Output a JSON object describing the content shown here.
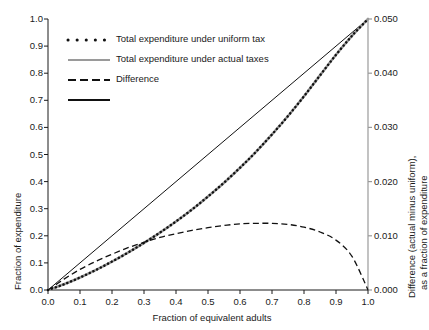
{
  "chart_data": {
    "type": "line",
    "title": "",
    "xlabel": "Fraction of equivalent adults",
    "ylabel": "Fraction of expenditure",
    "ylabel_right_line1": "Difference (actual minus uniform),",
    "ylabel_right_line2": "as a fraction of expenditure",
    "xlim": [
      0.0,
      1.0
    ],
    "ylim": [
      0.0,
      1.0
    ],
    "ylim_right": [
      0.0,
      0.05
    ],
    "grid": false,
    "legend_position": "upper left",
    "xticks": [
      "0.0",
      "0.1",
      "0.2",
      "0.3",
      "0.4",
      "0.5",
      "0.6",
      "0.7",
      "0.8",
      "0.9",
      "1.0"
    ],
    "xtick_values": [
      0.0,
      0.1,
      0.2,
      0.3,
      0.4,
      0.5,
      0.6,
      0.7,
      0.8,
      0.9,
      1.0
    ],
    "yticks": [
      "0.0",
      "0.1",
      "0.2",
      "0.3",
      "0.4",
      "0.5",
      "0.6",
      "0.7",
      "0.8",
      "0.9",
      "1.0"
    ],
    "ytick_values": [
      0.0,
      0.1,
      0.2,
      0.3,
      0.4,
      0.5,
      0.6,
      0.7,
      0.8,
      0.9,
      1.0
    ],
    "yticks_right": [
      "0.000",
      "0.010",
      "0.020",
      "0.030",
      "0.040",
      "0.050"
    ],
    "ytick_right_values": [
      0.0,
      0.01,
      0.02,
      0.03,
      0.04,
      0.05
    ],
    "series": [
      {
        "name": "Total expenditure under uniform tax",
        "style": "dotted",
        "color": "#111111",
        "axis": "left",
        "x": [
          0.0,
          0.05,
          0.1,
          0.15,
          0.2,
          0.25,
          0.3,
          0.35,
          0.4,
          0.45,
          0.5,
          0.55,
          0.6,
          0.65,
          0.7,
          0.75,
          0.8,
          0.85,
          0.9,
          0.95,
          1.0
        ],
        "values": [
          0.0,
          0.021,
          0.046,
          0.074,
          0.105,
          0.138,
          0.174,
          0.212,
          0.253,
          0.297,
          0.345,
          0.396,
          0.451,
          0.51,
          0.574,
          0.642,
          0.715,
          0.792,
          0.868,
          0.938,
          1.0
        ]
      },
      {
        "name": "Total expenditure under actual taxes",
        "style": "solid-gray",
        "color": "#9a9a9a",
        "axis": "left",
        "x": [
          0.0,
          0.05,
          0.1,
          0.15,
          0.2,
          0.25,
          0.3,
          0.35,
          0.4,
          0.45,
          0.5,
          0.55,
          0.6,
          0.65,
          0.7,
          0.75,
          0.8,
          0.85,
          0.9,
          0.95,
          1.0
        ],
        "values": [
          0.0,
          0.021,
          0.046,
          0.074,
          0.105,
          0.138,
          0.174,
          0.212,
          0.253,
          0.297,
          0.345,
          0.396,
          0.451,
          0.51,
          0.574,
          0.642,
          0.715,
          0.792,
          0.868,
          0.938,
          1.0
        ]
      },
      {
        "name": "Difference",
        "style": "dashed",
        "color": "#111111",
        "axis": "right",
        "x": [
          0.0,
          0.05,
          0.1,
          0.15,
          0.2,
          0.25,
          0.3,
          0.35,
          0.4,
          0.45,
          0.5,
          0.55,
          0.6,
          0.65,
          0.7,
          0.75,
          0.8,
          0.85,
          0.9,
          0.95,
          1.0
        ],
        "values": [
          0.0,
          0.002,
          0.0038,
          0.0053,
          0.0066,
          0.0078,
          0.0088,
          0.0097,
          0.0104,
          0.011,
          0.0115,
          0.0119,
          0.0122,
          0.0123,
          0.0123,
          0.0121,
          0.0116,
          0.0107,
          0.0092,
          0.0062,
          0.0
        ]
      },
      {
        "name": "",
        "style": "solid-black",
        "color": "#111111",
        "axis": "left",
        "x": [
          0.0,
          1.0
        ],
        "values": [
          0.0,
          1.0
        ]
      }
    ],
    "legend_entries": [
      {
        "label": "Total expenditure under uniform tax",
        "style": "dotted",
        "color": "#111111"
      },
      {
        "label": "Total expenditure under actual taxes",
        "style": "solid-gray",
        "color": "#9a9a9a"
      },
      {
        "label": "Difference",
        "style": "dashed",
        "color": "#111111"
      },
      {
        "label": "",
        "style": "solid-black",
        "color": "#111111"
      }
    ]
  }
}
